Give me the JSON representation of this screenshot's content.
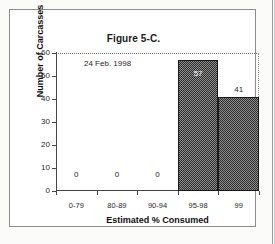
{
  "figure": {
    "title": "Figure 5-C.",
    "annotation": "24 Feb. 1998"
  },
  "chart_data": {
    "type": "bar",
    "title": "Figure 5-C.",
    "xlabel": "Estimated % Consumed",
    "ylabel": "Number of Carcasses",
    "categories": [
      "0-79",
      "80-89",
      "90-94",
      "95-98",
      "99"
    ],
    "values": [
      0,
      0,
      0,
      57,
      41
    ],
    "data_labels": [
      "0",
      "0",
      "0",
      "57",
      "41"
    ],
    "ylim": [
      0,
      60
    ],
    "yticks": [
      0,
      10,
      20,
      30,
      40,
      50,
      60
    ],
    "ytick_labels": [
      "0",
      "10",
      "20",
      "30",
      "40",
      "50",
      "60"
    ],
    "grid": false,
    "legend": "none",
    "annotations": [
      "24 Feb. 1998"
    ],
    "bar_style": "histogram-adjacent-dither-fill",
    "colors": {
      "bar_fill_dark": "#2b2b2b",
      "bar_fill_light": "#8f8f8f",
      "bar_outline": "#1a1a1a",
      "axis": "#454545",
      "text": "#1a1a1a",
      "background": "#ffffff",
      "frame": "#8d8d8d"
    }
  }
}
